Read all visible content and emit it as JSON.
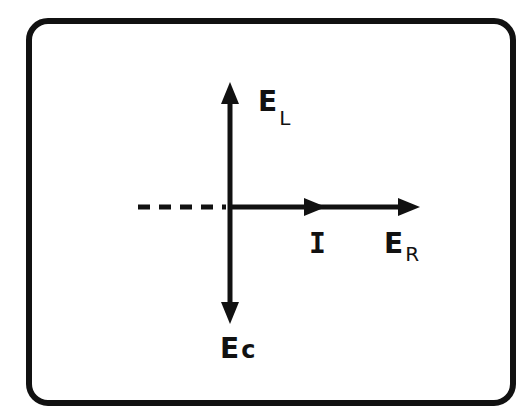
{
  "diagram": {
    "type": "phasor-diagram",
    "labels": {
      "inductor_voltage": {
        "main": "E",
        "sub": "L"
      },
      "resistor_voltage": {
        "main": "E",
        "sub": "R"
      },
      "capacitor_voltage": {
        "main": "E",
        "sub": "c"
      },
      "current": {
        "main": "I"
      }
    },
    "colors": {
      "stroke": "#111111",
      "background": "#ffffff"
    }
  }
}
